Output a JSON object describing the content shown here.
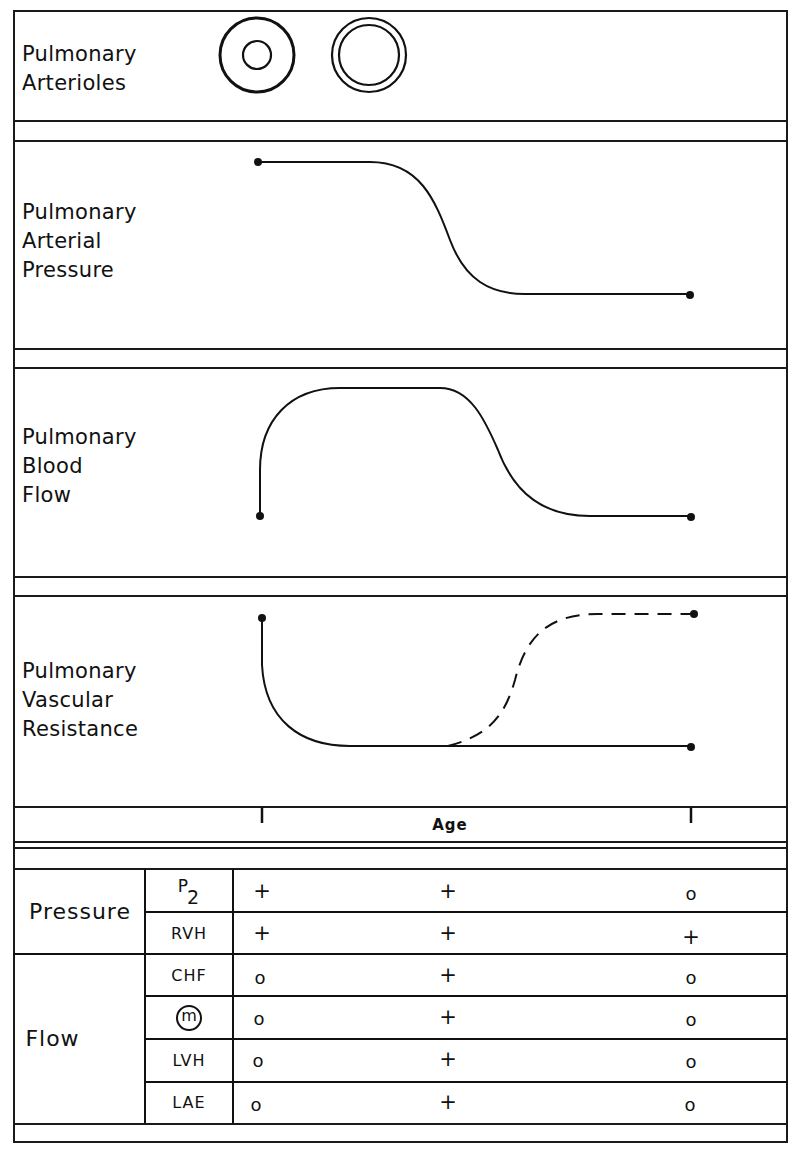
{
  "panels": {
    "arterioles": {
      "label_line1": "Pulmonary",
      "label_line2": "Arterioles"
    },
    "pressure": {
      "label_line1": "Pulmonary",
      "label_line2": "Arterial",
      "label_line3": "Pressure"
    },
    "flow": {
      "label_line1": "Pulmonary",
      "label_line2": "Blood",
      "label_line3": "Flow"
    },
    "resistance": {
      "label_line1": "Pulmonary",
      "label_line2": "Vascular",
      "label_line3": "Resistance"
    }
  },
  "axis": {
    "label": "Age"
  },
  "table": {
    "groups": [
      {
        "name": "Pressure",
        "rows": [
          {
            "sign": "P2",
            "values": [
              "+",
              "+",
              "o"
            ]
          },
          {
            "sign": "RVH",
            "values": [
              "+",
              "+",
              "+"
            ]
          }
        ]
      },
      {
        "name": "Flow",
        "rows": [
          {
            "sign": "CHF",
            "values": [
              "o",
              "+",
              "o"
            ]
          },
          {
            "sign": "m",
            "values": [
              "o",
              "+",
              "o"
            ]
          },
          {
            "sign": "LVH",
            "values": [
              "o",
              "+",
              "o"
            ]
          },
          {
            "sign": "LAE",
            "values": [
              "o",
              "+",
              "o"
            ]
          }
        ]
      }
    ],
    "p2_main": "P",
    "p2_sub": "2"
  }
}
